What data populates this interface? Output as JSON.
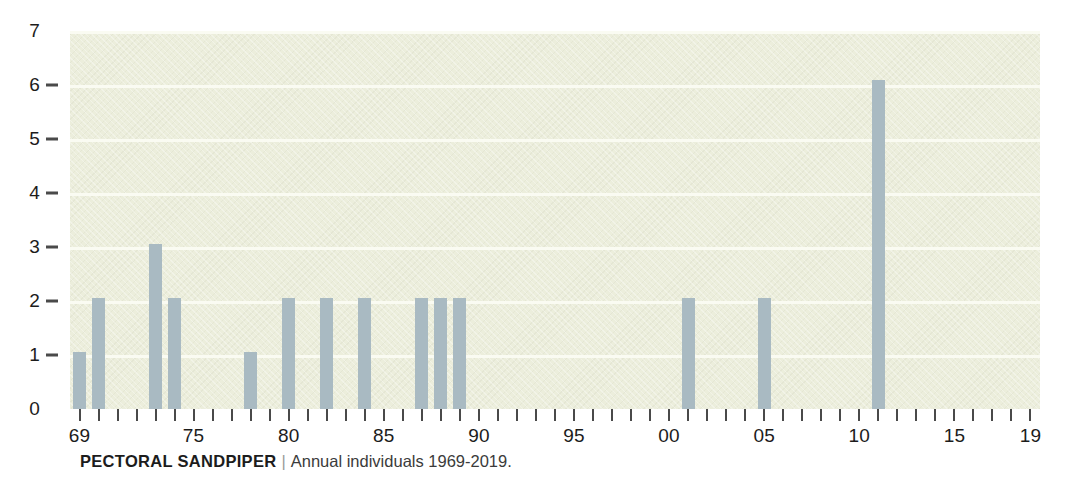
{
  "caption": {
    "species": "PECTORAL SANDPIPER",
    "separator": "|",
    "detail": "Annual individuals 1969-2019."
  },
  "colors": {
    "bar": "#a9bac2",
    "plot_background": "#eceedc",
    "gridline": "#fafbf2",
    "axis_text": "#1c1c1c",
    "page_background": "#ffffff"
  },
  "chart_data": {
    "type": "bar",
    "title": "PECTORAL SANDPIPER",
    "subtitle": "Annual individuals 1969-2019.",
    "xlabel": "",
    "ylabel": "",
    "xlim": [
      1968.5,
      2019.5
    ],
    "ylim": [
      0,
      7
    ],
    "grid": true,
    "legend": "none",
    "y_ticks": [
      0,
      1,
      2,
      3,
      4,
      5,
      6,
      7
    ],
    "y_tick_labels": [
      "0",
      "1",
      "2",
      "3",
      "4",
      "5",
      "6",
      "7"
    ],
    "x_tick_years": [
      1969,
      1970,
      1971,
      1972,
      1973,
      1974,
      1975,
      1976,
      1977,
      1978,
      1979,
      1980,
      1981,
      1982,
      1983,
      1984,
      1985,
      1986,
      1987,
      1988,
      1989,
      1990,
      1991,
      1992,
      1993,
      1994,
      1995,
      1996,
      1997,
      1998,
      1999,
      2000,
      2001,
      2002,
      2003,
      2004,
      2005,
      2006,
      2007,
      2008,
      2009,
      2010,
      2011,
      2012,
      2013,
      2014,
      2015,
      2016,
      2017,
      2018,
      2019
    ],
    "x_labeled_ticks": [
      {
        "year": 1969,
        "label": "69"
      },
      {
        "year": 1975,
        "label": "75"
      },
      {
        "year": 1980,
        "label": "80"
      },
      {
        "year": 1985,
        "label": "85"
      },
      {
        "year": 1990,
        "label": "90"
      },
      {
        "year": 1995,
        "label": "95"
      },
      {
        "year": 2000,
        "label": "00"
      },
      {
        "year": 2005,
        "label": "05"
      },
      {
        "year": 2010,
        "label": "10"
      },
      {
        "year": 2015,
        "label": "15"
      },
      {
        "year": 2019,
        "label": "19"
      }
    ],
    "categories": [
      1969,
      1970,
      1971,
      1972,
      1973,
      1974,
      1975,
      1976,
      1977,
      1978,
      1979,
      1980,
      1981,
      1982,
      1983,
      1984,
      1985,
      1986,
      1987,
      1988,
      1989,
      1990,
      1991,
      1992,
      1993,
      1994,
      1995,
      1996,
      1997,
      1998,
      1999,
      2000,
      2001,
      2002,
      2003,
      2004,
      2005,
      2006,
      2007,
      2008,
      2009,
      2010,
      2011,
      2012,
      2013,
      2014,
      2015,
      2016,
      2017,
      2018,
      2019
    ],
    "values": [
      1.05,
      2.05,
      0,
      0,
      3.05,
      2.05,
      0,
      0,
      0,
      1.05,
      0,
      2.05,
      0,
      2.05,
      0,
      2.05,
      0,
      0,
      2.05,
      2.05,
      2.05,
      0,
      0,
      0,
      0,
      0,
      0,
      0,
      0,
      0,
      0,
      0,
      2.05,
      0,
      0,
      0,
      2.05,
      0,
      0,
      0,
      0,
      0,
      6.1,
      0,
      0,
      0,
      0,
      0,
      0,
      0,
      0
    ]
  }
}
